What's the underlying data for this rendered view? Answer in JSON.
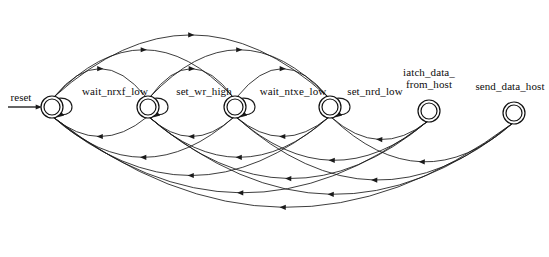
{
  "diagram": {
    "type": "finite-state-machine",
    "background_color": "#ffffff",
    "line_color": "#1a1a1a",
    "canvas": {
      "width": 549,
      "height": 257
    }
  },
  "reset": {
    "label": "reset",
    "target_state": "wait_nrxf_low",
    "arrow_from_x": 8,
    "arrow_to_x": 38,
    "y": 107
  },
  "states": [
    {
      "id": "wait_nrxf_low",
      "label": "wait_nrxf_low",
      "index": 0,
      "cx": 52,
      "cy": 107,
      "r_outer": 11,
      "r_inner": 8,
      "accepting": true,
      "self_loop": true,
      "label_x": 115,
      "label_y": 95
    },
    {
      "id": "set_wr_high",
      "label": "set_wr_high",
      "index": 1,
      "cx": 148,
      "cy": 107,
      "r_outer": 11,
      "r_inner": 8,
      "accepting": true,
      "self_loop": true,
      "label_x": 204,
      "label_y": 95
    },
    {
      "id": "wait_ntxe_low",
      "label": "wait_ntxe_low",
      "index": 2,
      "cx": 235,
      "cy": 107,
      "r_outer": 11,
      "r_inner": 8,
      "accepting": true,
      "self_loop": true,
      "label_x": 293,
      "label_y": 95
    },
    {
      "id": "set_nrd_low",
      "label": "set_nrd_low",
      "index": 3,
      "cx": 330,
      "cy": 107,
      "r_outer": 11,
      "r_inner": 8,
      "accepting": true,
      "self_loop": true,
      "label_x": 375,
      "label_y": 95
    },
    {
      "id": "latch_data_from_host",
      "label": "iatch_data_",
      "label_line2": "from_host",
      "index": 4,
      "cx": 429,
      "cy": 111,
      "r_outer": 11,
      "r_inner": 8,
      "accepting": true,
      "self_loop": false,
      "label_x": 429,
      "label_y": 76
    },
    {
      "id": "send_data_host",
      "label": "send_data_host",
      "index": 5,
      "cx": 514,
      "cy": 113,
      "r_outer": 11,
      "r_inner": 8,
      "accepting": true,
      "self_loop": false,
      "label_x": 510,
      "label_y": 90
    }
  ],
  "transitions": {
    "forward_arcs": [
      {
        "from": "wait_nrxf_low",
        "to": "set_wr_high",
        "lift": 42
      },
      {
        "from": "wait_nrxf_low",
        "to": "wait_ntxe_low",
        "lift": 70
      },
      {
        "from": "wait_nrxf_low",
        "to": "set_nrd_low",
        "lift": 92
      },
      {
        "from": "set_wr_high",
        "to": "wait_ntxe_low",
        "lift": 42
      },
      {
        "from": "set_wr_high",
        "to": "set_nrd_low",
        "lift": 70
      },
      {
        "from": "wait_ntxe_low",
        "to": "set_nrd_low",
        "lift": 42
      }
    ],
    "backward_arcs": [
      {
        "from": "set_wr_high",
        "to": "wait_nrxf_low",
        "drop": 30
      },
      {
        "from": "wait_ntxe_low",
        "to": "set_wr_high",
        "drop": 30
      },
      {
        "from": "set_nrd_low",
        "to": "wait_ntxe_low",
        "drop": 30
      },
      {
        "from": "latch_data_from_host",
        "to": "set_nrd_low",
        "drop": 30
      },
      {
        "from": "wait_ntxe_low",
        "to": "wait_nrxf_low",
        "drop": 62
      },
      {
        "from": "set_nrd_low",
        "to": "set_wr_high",
        "drop": 62
      },
      {
        "from": "latch_data_from_host",
        "to": "wait_ntxe_low",
        "drop": 62
      },
      {
        "from": "send_data_host",
        "to": "set_nrd_low",
        "drop": 62
      },
      {
        "from": "set_nrd_low",
        "to": "wait_nrxf_low",
        "drop": 90
      },
      {
        "from": "latch_data_from_host",
        "to": "set_wr_high",
        "drop": 90
      },
      {
        "from": "send_data_host",
        "to": "wait_ntxe_low",
        "drop": 90
      },
      {
        "from": "latch_data_from_host",
        "to": "wait_nrxf_low",
        "drop": 112
      },
      {
        "from": "send_data_host",
        "to": "set_wr_high",
        "drop": 112
      },
      {
        "from": "send_data_host",
        "to": "wait_nrxf_low",
        "drop": 132
      }
    ],
    "self_loops": [
      {
        "state": "wait_nrxf_low"
      },
      {
        "state": "set_wr_high"
      },
      {
        "state": "wait_ntxe_low"
      },
      {
        "state": "set_nrd_low"
      }
    ]
  }
}
